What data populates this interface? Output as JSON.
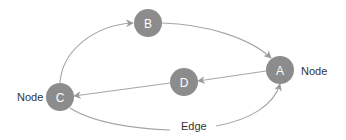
{
  "diagram": {
    "type": "directed-graph",
    "colors": {
      "node_fill": "#8c8c8c",
      "node_text": "#ffffff",
      "edge": "#a6a6a6",
      "label_text": "#333333"
    },
    "nodes": [
      {
        "id": "A",
        "label": "A",
        "cx": 280,
        "cy": 70
      },
      {
        "id": "B",
        "label": "B",
        "cx": 148,
        "cy": 23
      },
      {
        "id": "C",
        "label": "C",
        "cx": 60,
        "cy": 97
      },
      {
        "id": "D",
        "label": "D",
        "cx": 184,
        "cy": 82
      }
    ],
    "edges": [
      {
        "from": "C",
        "to": "B"
      },
      {
        "from": "B",
        "to": "A"
      },
      {
        "from": "A",
        "to": "D"
      },
      {
        "from": "D",
        "to": "C"
      },
      {
        "from": "C",
        "to": "A"
      }
    ],
    "annotations": {
      "node_label_right": "Node",
      "node_label_left": "Node",
      "edge_label": "Edge"
    }
  }
}
